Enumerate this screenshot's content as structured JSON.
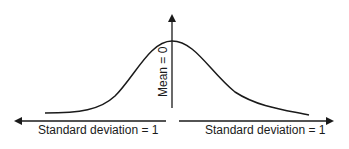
{
  "diagram": {
    "type": "normal-distribution",
    "mean_label": "Mean = 0",
    "left_sd_label": "Standard deviation = 1",
    "right_sd_label": "Standard deviation = 1",
    "colors": {
      "line": "#1a1a1a",
      "background": "#ffffff"
    }
  }
}
